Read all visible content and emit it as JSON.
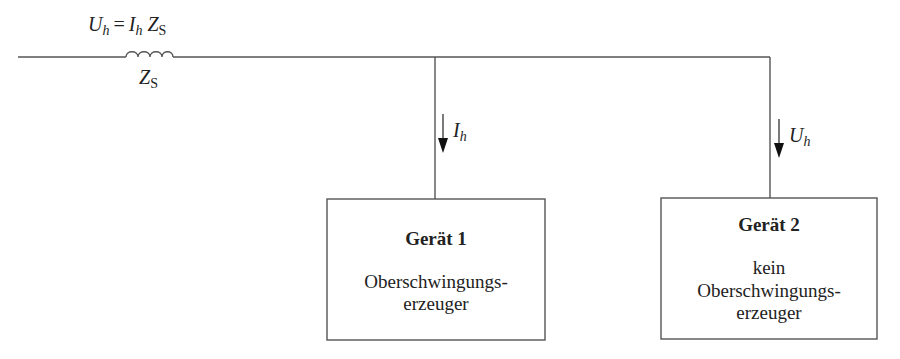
{
  "diagram": {
    "type": "circuit-schematic",
    "source_impedance": {
      "symbol": "Z",
      "subscript": "S",
      "shape": "inductor"
    },
    "top_equation": {
      "lhs_symbol": "U",
      "lhs_subscript": "h",
      "equals": "=",
      "rhs_current_symbol": "I",
      "rhs_current_subscript": "h",
      "rhs_impedance_symbol": "Z",
      "rhs_impedance_subscript": "S"
    },
    "branch_1": {
      "arrow_symbol": "I",
      "arrow_subscript": "h",
      "arrow_direction": "down",
      "device": {
        "title": "Gerät 1",
        "lines": [
          "Oberschwingungs-",
          "erzeuger"
        ]
      }
    },
    "branch_2": {
      "arrow_symbol": "U",
      "arrow_subscript": "h",
      "arrow_direction": "down",
      "device": {
        "title": "Gerät 2",
        "lines": [
          "kein",
          "Oberschwingungs-",
          "erzeuger"
        ]
      }
    },
    "colors": {
      "line": "#555555",
      "text": "#222222",
      "background": "#ffffff"
    }
  }
}
